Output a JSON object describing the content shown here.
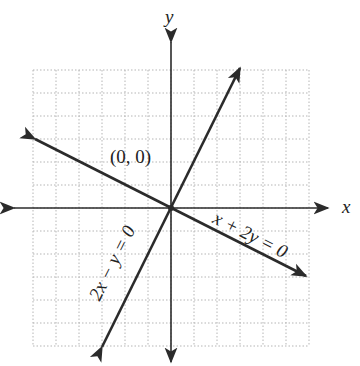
{
  "chart_data": {
    "type": "line",
    "title": "",
    "xlabel": "x",
    "ylabel": "y",
    "xlim": [
      -6,
      6
    ],
    "ylim": [
      -6,
      6
    ],
    "grid": true,
    "grid_style": "dotted",
    "series": [
      {
        "name": "2x − y = 0",
        "equation": "y = 2x",
        "points": [
          [
            -3,
            -6
          ],
          [
            3,
            6
          ]
        ]
      },
      {
        "name": "x + 2y = 0",
        "equation": "y = -x/2",
        "points": [
          [
            -6,
            3
          ],
          [
            6,
            -3
          ]
        ]
      }
    ],
    "annotations": [
      {
        "text": "(0, 0)",
        "x": 0,
        "y": 0
      }
    ]
  },
  "labels": {
    "x_axis": "x",
    "y_axis": "y",
    "origin": "(0, 0)",
    "line1": "2x − y = 0",
    "line2": "x + 2y = 0"
  },
  "colors": {
    "line": "#2b2b2b",
    "grid": "#b5b5b5"
  }
}
